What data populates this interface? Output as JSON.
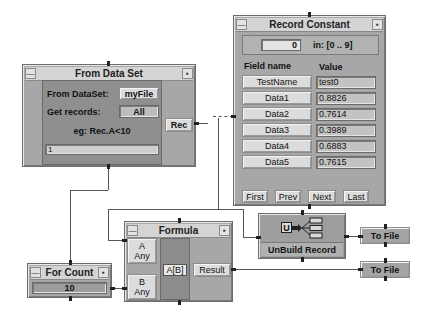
{
  "from_data_set": {
    "title": "From Data Set",
    "dataset_label": "From DataSet:",
    "dataset_value": "myFile",
    "records_label": "Get records:",
    "records_value": "All",
    "example_text": "eg: Rec.A<10",
    "expression_value": "1",
    "output_pin": "Rec"
  },
  "record_constant": {
    "title": "Record Constant",
    "index_value": "0",
    "range_text": "in: [0 .. 9]",
    "col_field": "Field name",
    "col_value": "Value",
    "rows": [
      {
        "field": "TestName",
        "value": "test0"
      },
      {
        "field": "Data1",
        "value": "0.8826"
      },
      {
        "field": "Data2",
        "value": "0.7614"
      },
      {
        "field": "Data3",
        "value": "0.3989"
      },
      {
        "field": "Data4",
        "value": "0.6883"
      },
      {
        "field": "Data5",
        "value": "0.7615"
      }
    ],
    "nav": {
      "first": "First",
      "prev": "Prev",
      "next": "Next",
      "last": "Last"
    }
  },
  "formula": {
    "title": "Formula",
    "input_a_name": "A",
    "input_a_type": "Any",
    "input_b_name": "B",
    "input_b_type": "Any",
    "expression": "A[B]",
    "output_pin": "Result"
  },
  "for_count": {
    "title": "For Count",
    "value": "10"
  },
  "unbuild_record": {
    "title": "UnBuild Record",
    "icon_letter": "U"
  },
  "to_file_1": {
    "label": "To File"
  },
  "to_file_2": {
    "label": "To File"
  },
  "titlebar_icons": {
    "minimize": "—",
    "resize": "▪"
  }
}
